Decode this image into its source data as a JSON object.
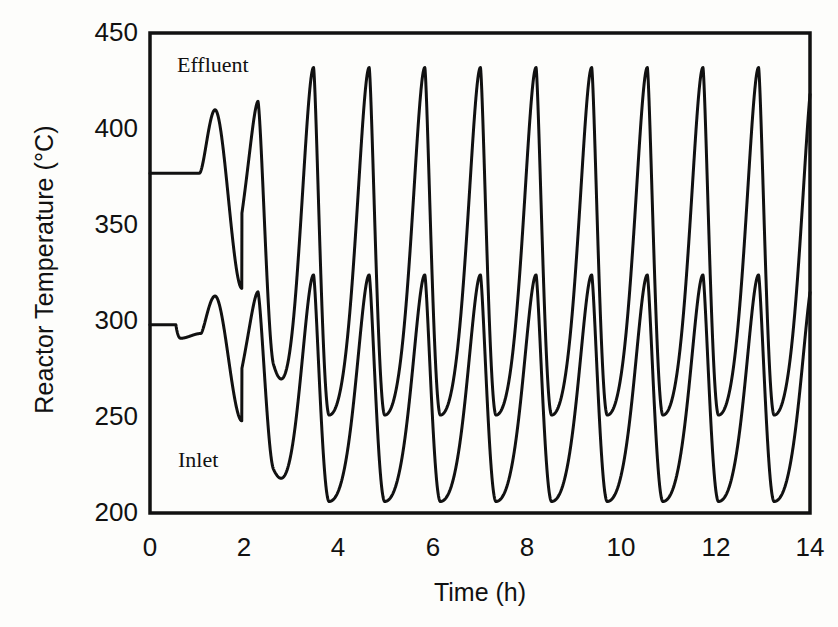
{
  "chart_data": {
    "type": "line",
    "title": "",
    "xlabel": "Time (h)",
    "ylabel": "Reactor Temperature (°C)",
    "xlim": [
      0,
      14
    ],
    "ylim": [
      200,
      450
    ],
    "xticks": [
      0,
      2,
      4,
      6,
      8,
      10,
      12,
      14
    ],
    "yticks": [
      200,
      250,
      300,
      350,
      400,
      450
    ],
    "grid": false,
    "legend_position": "in-plot-annotations",
    "line_color": "#000000",
    "background_color": "#fdfdfb",
    "frame": "box",
    "series": [
      {
        "name": "Effluent",
        "annotation_x": 1.1,
        "annotation_y": 437,
        "initial_steady_value": 377,
        "initial_steady_until_h": 1.05,
        "first_transient_peak": {
          "x": 1.38,
          "y": 410
        },
        "first_transient_trough": {
          "x": 1.95,
          "y": 317
        },
        "oscillation_peak": 432,
        "oscillation_trough": 251,
        "period_h": 1.18,
        "peaks_x": [
          2.62,
          3.8,
          4.98,
          6.16,
          7.34,
          8.52,
          9.7,
          10.88,
          12.06,
          13.24
        ],
        "troughs_x": [
          3.0,
          4.18,
          5.36,
          6.54,
          7.72,
          8.9,
          10.08,
          11.26,
          12.44,
          13.62
        ],
        "end_value_at_14h": 370
      },
      {
        "name": "Inlet",
        "annotation_x": 0.55,
        "annotation_y": 224,
        "initial_steady_value": 298,
        "step_down_at_h": 0.55,
        "post_step_value": 291,
        "first_transient_peak": {
          "x": 1.38,
          "y": 313
        },
        "first_transient_trough": {
          "x": 1.95,
          "y": 248
        },
        "oscillation_peak": 324,
        "oscillation_trough": 206,
        "period_h": 1.18,
        "peaks_x": [
          2.62,
          3.8,
          4.98,
          6.16,
          7.34,
          8.52,
          9.7,
          10.88,
          12.06,
          13.24
        ],
        "troughs_x": [
          3.0,
          4.18,
          5.36,
          6.54,
          7.72,
          8.9,
          10.08,
          11.26,
          12.44,
          13.62
        ],
        "end_value_at_14h": 276
      }
    ]
  },
  "axes": {
    "ylabel": "Reactor Temperature (°C)",
    "xlabel": "Time (h)",
    "ytick_labels": [
      "450",
      "400",
      "350",
      "300",
      "250",
      "200"
    ],
    "xtick_labels": [
      "0",
      "2",
      "4",
      "6",
      "8",
      "10",
      "12",
      "14"
    ]
  },
  "annotations": {
    "effluent": "Effluent",
    "inlet": "Inlet"
  }
}
